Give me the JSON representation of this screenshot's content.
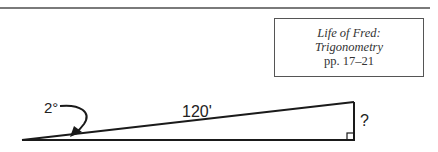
{
  "reference": {
    "title": "Life of Fred:",
    "subtitle": "Trigonometry",
    "pages": "pp. 17–21"
  },
  "diagram": {
    "angle_label": "2°",
    "hypotenuse_label": "120'",
    "opposite_label": "?",
    "right_angle_marker": true,
    "colors": {
      "line": "#1a1a1a",
      "rule": "#7a7a7a",
      "box_border": "#555555"
    }
  }
}
